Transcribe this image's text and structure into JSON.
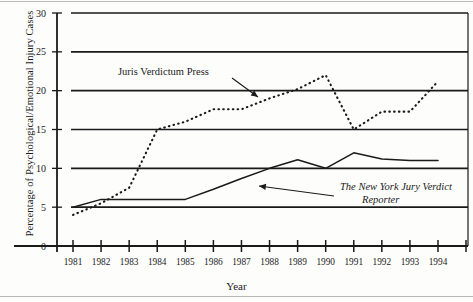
{
  "chart_data": {
    "type": "line",
    "title": "",
    "xlabel": "Year",
    "ylabel": "Percentage of Psychological/Emotional Injury Cases",
    "x": [
      1981,
      1982,
      1983,
      1984,
      1985,
      1986,
      1987,
      1988,
      1989,
      1990,
      1991,
      1992,
      1993,
      1994
    ],
    "categories": [
      "1981",
      "1982",
      "1983",
      "1984",
      "1985",
      "1986",
      "1987",
      "1988",
      "1989",
      "1990",
      "1991",
      "1992",
      "1993",
      "1994"
    ],
    "xlim": [
      1981,
      1994
    ],
    "ylim": [
      0,
      30
    ],
    "yticks": [
      0,
      5,
      10,
      15,
      20,
      25,
      30
    ],
    "ytick_labels": [
      "0",
      "5",
      "10",
      "15",
      "20",
      "25",
      "30"
    ],
    "grid": true,
    "grid_axis": "y",
    "legend": "none (inline annotations with leader arrows)",
    "series": [
      {
        "name": "Juris Verdictum Press",
        "style": "dotted",
        "color": "#1a1a1a",
        "values": [
          4.0,
          5.5,
          7.5,
          15.0,
          16.0,
          17.6,
          17.6,
          19.0,
          20.2,
          22.0,
          15.0,
          17.3,
          17.3,
          21.2
        ]
      },
      {
        "name": "The New York Jury Verdict Reporter",
        "style": "solid",
        "color": "#1a1a1a",
        "values": [
          5.0,
          6.0,
          6.0,
          6.0,
          6.0,
          7.3,
          8.7,
          10.0,
          11.1,
          10.0,
          12.0,
          11.2,
          11.0,
          11.0
        ]
      }
    ],
    "annotations": [
      {
        "text": "Juris Verdictum Press",
        "style": "roman",
        "x_px": 118,
        "y_px": 75,
        "arrow_from": [
          232,
          78
        ],
        "arrow_to": [
          258,
          97
        ]
      },
      {
        "text_line1": "The New York Jury Verdict",
        "text_line2": "Reporter",
        "style": "italic",
        "x_px": 340,
        "y_px": 190,
        "arrow_from": [
          334,
          196
        ],
        "arrow_to": [
          259,
          186
        ]
      }
    ]
  },
  "axis": {
    "y_title": "Percentage of Psychological/Emotional Injury Cases",
    "x_title": "Year"
  }
}
